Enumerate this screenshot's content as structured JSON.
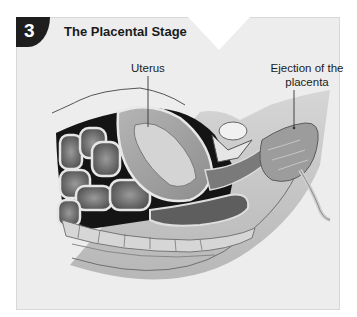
{
  "figure": {
    "step_number": "3",
    "title": "The Placental Stage",
    "labels": {
      "uterus": "Uterus",
      "ejection": "Ejection of the placenta"
    },
    "colors": {
      "panel_bg": "#ededed",
      "badge_bg": "#1e1e1e",
      "badge_text": "#ffffff",
      "title_text": "#1a1a1a",
      "leader_line": "#333333"
    }
  }
}
